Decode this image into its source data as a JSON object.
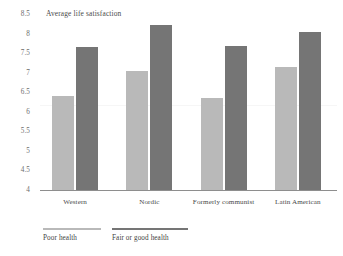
{
  "chart_data": {
    "type": "bar",
    "title": "",
    "ylabel": "Average life satisfaction",
    "xlabel": "",
    "ylim": [
      4,
      8.5
    ],
    "yticks": [
      "8.5",
      "8",
      "7.5",
      "7",
      "6.5",
      "6",
      "5.5",
      "5",
      "4.5",
      "4"
    ],
    "ytick_values": [
      8.5,
      8,
      7.5,
      7,
      6.5,
      6,
      5.5,
      5,
      4.5,
      4
    ],
    "grid": false,
    "legend_position": "bottom-left",
    "categories": [
      "Western",
      "Nordic",
      "Formerly communist",
      "Latin American"
    ],
    "series": [
      {
        "name": "Poor health",
        "color": "#b9b9b9",
        "values": [
          6.4,
          7.05,
          6.35,
          7.15
        ]
      },
      {
        "name": "Fair or good health",
        "color": "#757575",
        "values": [
          7.65,
          8.22,
          7.68,
          8.05
        ]
      }
    ]
  },
  "axis": {
    "caption": "Average life satisfaction"
  },
  "legend": {
    "items": [
      {
        "label": "Poor health"
      },
      {
        "label": "Fair or good health"
      }
    ]
  }
}
